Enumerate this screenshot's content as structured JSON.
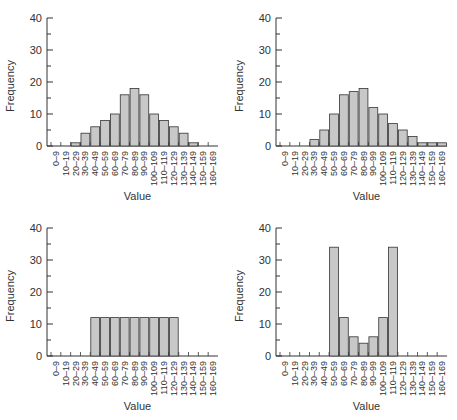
{
  "chart_data": [
    {
      "type": "bar",
      "title": "",
      "xlabel": "Value",
      "ylabel": "Frequency",
      "ylim": [
        0,
        40
      ],
      "yticks": [
        0,
        10,
        20,
        30,
        40
      ],
      "categories": [
        "0–9",
        "10–19",
        "20–29",
        "30–39",
        "40–49",
        "50–59",
        "60–69",
        "70–79",
        "80–89",
        "90–99",
        "100–109",
        "110–119",
        "120–129",
        "130–139",
        "140–149",
        "150–159",
        "160–169"
      ],
      "values": [
        0,
        0,
        1,
        4,
        6,
        8,
        10,
        16,
        18,
        16,
        10,
        8,
        6,
        4,
        1,
        0,
        0
      ],
      "grid": false,
      "position": "top-left"
    },
    {
      "type": "bar",
      "title": "",
      "xlabel": "Value",
      "ylabel": "Frequency",
      "ylim": [
        0,
        40
      ],
      "yticks": [
        0,
        10,
        20,
        30,
        40
      ],
      "categories": [
        "0–9",
        "10–19",
        "20–29",
        "30–39",
        "40–49",
        "50–59",
        "60–69",
        "70–79",
        "80–89",
        "90–99",
        "100–109",
        "110–119",
        "120–129",
        "130–139",
        "140–149",
        "150–159",
        "160–169"
      ],
      "values": [
        0,
        0,
        0,
        2,
        5,
        10,
        16,
        17,
        18,
        12,
        10,
        7,
        5,
        3,
        1,
        1,
        1
      ],
      "grid": false,
      "position": "top-right"
    },
    {
      "type": "bar",
      "title": "",
      "xlabel": "Value",
      "ylabel": "Frequency",
      "ylim": [
        0,
        40
      ],
      "yticks": [
        0,
        10,
        20,
        30,
        40
      ],
      "categories": [
        "0–9",
        "10–19",
        "20–29",
        "30–39",
        "40–49",
        "50–59",
        "60–69",
        "70–79",
        "80–89",
        "90–99",
        "100–109",
        "110–119",
        "120–129",
        "130–139",
        "140–149",
        "150–159",
        "160–169"
      ],
      "values": [
        0,
        0,
        0,
        0,
        12,
        12,
        12,
        12,
        12,
        12,
        12,
        12,
        12,
        0,
        0,
        0,
        0
      ],
      "grid": false,
      "position": "bottom-left"
    },
    {
      "type": "bar",
      "title": "",
      "xlabel": "Value",
      "ylabel": "Frequency",
      "ylim": [
        0,
        40
      ],
      "yticks": [
        0,
        10,
        20,
        30,
        40
      ],
      "categories": [
        "0–9",
        "10–19",
        "20–29",
        "30–39",
        "40–49",
        "50–59",
        "60–69",
        "70–79",
        "80–89",
        "90–99",
        "100–109",
        "110–119",
        "120–129",
        "130–139",
        "140–149",
        "150–159",
        "160–169"
      ],
      "values": [
        0,
        0,
        0,
        0,
        0,
        34,
        12,
        6,
        4,
        6,
        12,
        34,
        0,
        0,
        0,
        0,
        0
      ],
      "grid": false,
      "position": "bottom-right"
    }
  ],
  "style": {
    "bar_fill": "#c8c8c8",
    "bar_stroke": "#333333",
    "axis_color": "#333333"
  }
}
